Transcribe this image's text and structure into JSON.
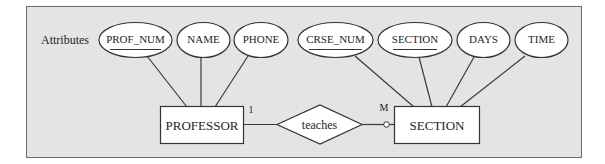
{
  "diagram": {
    "type": "er-diagram",
    "attributes_label": "Attributes",
    "colors": {
      "background": "#e4e4e4",
      "shape_fill": "#ffffff",
      "stroke": "#333333",
      "text": "#1e1e1e"
    },
    "entities": [
      {
        "id": "professor",
        "label": "PROFESSOR"
      },
      {
        "id": "section",
        "label": "SECTION"
      }
    ],
    "relationship": {
      "label": "teaches",
      "left_cardinality": "1",
      "right_cardinality": "M",
      "right_optional": true
    },
    "attributes": [
      {
        "label": "PROF_NUM",
        "entity": "professor",
        "key": true
      },
      {
        "label": "NAME",
        "entity": "professor",
        "key": false
      },
      {
        "label": "PHONE",
        "entity": "professor",
        "key": false
      },
      {
        "label": "CRSE_NUM",
        "entity": "section",
        "key": true
      },
      {
        "label": "SECTION",
        "entity": "section",
        "key": true
      },
      {
        "label": "DAYS",
        "entity": "section",
        "key": false
      },
      {
        "label": "TIME",
        "entity": "section",
        "key": false
      }
    ]
  }
}
